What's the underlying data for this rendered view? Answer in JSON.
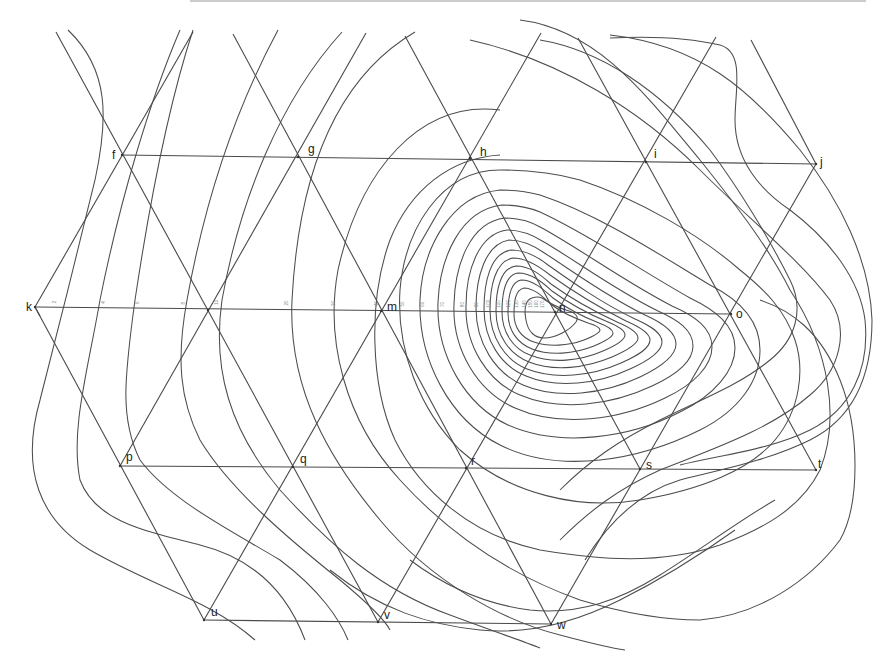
{
  "diagram": {
    "title": "",
    "nodes": [
      {
        "id": "f",
        "label": "f",
        "x": 122,
        "y": 155,
        "lx": -10,
        "ly": 4
      },
      {
        "id": "g",
        "label": "g",
        "x": 298,
        "y": 157,
        "lx": 10,
        "ly": -4
      },
      {
        "id": "h",
        "label": "h",
        "x": 470,
        "y": 158,
        "lx": 10,
        "ly": -2
      },
      {
        "id": "i",
        "label": "i",
        "x": 646,
        "y": 162,
        "lx": 8,
        "ly": -4
      },
      {
        "id": "j",
        "label": "j",
        "x": 816,
        "y": 164,
        "lx": 4,
        "ly": 2
      },
      {
        "id": "k",
        "label": "k",
        "x": 35,
        "y": 307,
        "lx": -9,
        "ly": 4
      },
      {
        "id": "l",
        "label": "",
        "x": 208,
        "y": 310,
        "lx": 0,
        "ly": 0
      },
      {
        "id": "m",
        "label": "m",
        "x": 381,
        "y": 311,
        "lx": 6,
        "ly": 0
      },
      {
        "id": "n",
        "label": "n",
        "x": 555,
        "y": 312,
        "lx": 4,
        "ly": 0
      },
      {
        "id": "o",
        "label": "o",
        "x": 731,
        "y": 314,
        "lx": 5,
        "ly": 4
      },
      {
        "id": "p",
        "label": "p",
        "x": 120,
        "y": 466,
        "lx": 6,
        "ly": -5
      },
      {
        "id": "q",
        "label": "q",
        "x": 293,
        "y": 467,
        "lx": 7,
        "ly": -4
      },
      {
        "id": "r",
        "label": "r",
        "x": 466,
        "y": 468,
        "lx": 5,
        "ly": -3
      },
      {
        "id": "s",
        "label": "s",
        "x": 640,
        "y": 469,
        "lx": 6,
        "ly": 0
      },
      {
        "id": "t",
        "label": "t",
        "x": 816,
        "y": 470,
        "lx": 2,
        "ly": -2
      },
      {
        "id": "u",
        "label": "u",
        "x": 204,
        "y": 620,
        "lx": 7,
        "ly": -4
      },
      {
        "id": "v",
        "label": "v",
        "x": 378,
        "y": 622,
        "lx": 6,
        "ly": -3
      },
      {
        "id": "w",
        "label": "w",
        "x": 551,
        "y": 624,
        "lx": 6,
        "ly": 5
      }
    ],
    "contour_labels_k_to_n": [
      "2",
      "4",
      "6",
      "8",
      "10",
      "20",
      "30",
      "40",
      "50",
      "60",
      "70",
      "80",
      "90",
      "100",
      "110",
      "120",
      "130",
      "140",
      "150",
      "160",
      "170"
    ],
    "contour_label_positions": [
      56,
      105,
      139,
      185,
      218,
      288,
      335,
      378,
      404,
      424,
      444,
      464,
      478,
      490,
      500,
      510,
      518,
      526,
      532,
      538,
      544
    ],
    "peak_label": "170",
    "colors": {
      "line": "#4a4a4a",
      "contour": "#4d4d4d",
      "background": "#ffffff",
      "top_border": "#9a9a9a"
    }
  }
}
